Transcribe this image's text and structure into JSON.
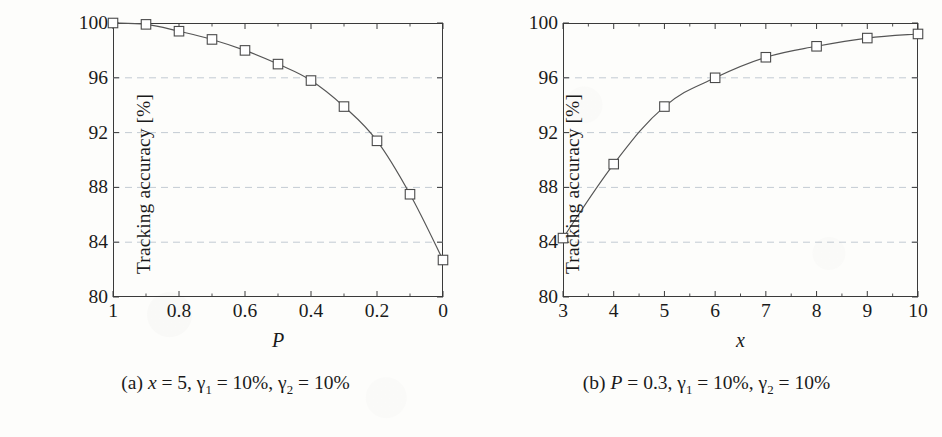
{
  "figure": {
    "panels": [
      {
        "id": "a",
        "caption_prefix": "(a)",
        "caption_plain": "(a) x = 5, γ1 = 10%, γ2 = 10%",
        "caption_parts": {
          "var1_name": "x",
          "var1_eq": "= 5,",
          "gamma1_name": "γ",
          "gamma1_sub": "1",
          "gamma1_eq": "= 10%,",
          "gamma2_name": "γ",
          "gamma2_sub": "2",
          "gamma2_eq": "= 10%"
        },
        "chart_data": {
          "type": "line",
          "title": "",
          "xlabel": "P",
          "ylabel": "Tracking accuracy [%]",
          "xlim": [
            1,
            0
          ],
          "ylim": [
            80,
            100
          ],
          "x_reversed": true,
          "grid": true,
          "grid_axis": "y",
          "legend": false,
          "xticks": [
            1,
            0.8,
            0.6,
            0.4,
            0.2,
            0
          ],
          "xticklabels": [
            "1",
            "0.8",
            "0.6",
            "0.4",
            "0.2",
            "0"
          ],
          "x_minor_ticks": [
            0.9,
            0.7,
            0.5,
            0.3,
            0.1
          ],
          "yticks": [
            80,
            84,
            88,
            92,
            96,
            100
          ],
          "yticklabels": [
            "80",
            "84",
            "88",
            "92",
            "96",
            "100"
          ],
          "marker": "open-square",
          "x": [
            1,
            0.9,
            0.8,
            0.7,
            0.6,
            0.5,
            0.4,
            0.3,
            0.2,
            0.1,
            0
          ],
          "values": [
            100.0,
            99.9,
            99.4,
            98.8,
            98.0,
            97.0,
            95.8,
            93.9,
            91.4,
            87.5,
            82.7
          ]
        }
      },
      {
        "id": "b",
        "caption_prefix": "(b)",
        "caption_plain": "(b) P = 0.3, γ1 = 10%, γ2 = 10%",
        "caption_parts": {
          "var1_name": "P",
          "var1_eq": "= 0.3,",
          "gamma1_name": "γ",
          "gamma1_sub": "1",
          "gamma1_eq": "= 10%,",
          "gamma2_name": "γ",
          "gamma2_sub": "2",
          "gamma2_eq": "= 10%"
        },
        "chart_data": {
          "type": "line",
          "title": "",
          "xlabel": "x",
          "ylabel": "Tracking accuracy [%]",
          "xlim": [
            3,
            10
          ],
          "ylim": [
            80,
            100
          ],
          "x_reversed": false,
          "grid": true,
          "grid_axis": "y",
          "legend": false,
          "xticks": [
            3,
            4,
            5,
            6,
            7,
            8,
            9,
            10
          ],
          "xticklabels": [
            "3",
            "4",
            "5",
            "6",
            "7",
            "8",
            "9",
            "10"
          ],
          "x_minor_ticks": [
            3.5,
            4.5,
            5.5,
            6.5,
            7.5,
            8.5,
            9.5
          ],
          "yticks": [
            80,
            84,
            88,
            92,
            96,
            100
          ],
          "yticklabels": [
            "80",
            "84",
            "88",
            "92",
            "96",
            "100"
          ],
          "marker": "open-square",
          "x": [
            3,
            4,
            5,
            6,
            7,
            8,
            9,
            10
          ],
          "values": [
            84.3,
            89.7,
            93.9,
            96.0,
            97.5,
            98.3,
            98.9,
            99.2
          ]
        }
      }
    ]
  },
  "colors": {
    "line": "#555555",
    "marker_stroke": "#4a4a4a",
    "marker_fill": "#ffffff",
    "frame": "#3a3a3a",
    "grid": "#b9c2cc",
    "text": "#1a1a1a",
    "background": "#fdfdfb"
  }
}
